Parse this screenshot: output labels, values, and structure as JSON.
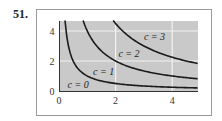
{
  "problem": {
    "number": "51."
  },
  "colors": {
    "plot_bg": "#c9c9c9",
    "grid": "#f2f2f2",
    "curve": "#1a1a1a",
    "frame": "#9a9a9a"
  },
  "chart_data": {
    "type": "line",
    "title": "",
    "xlabel": "",
    "ylabel": "",
    "xlim": [
      0,
      4.9
    ],
    "ylim": [
      0,
      4.7
    ],
    "xticks": [
      0,
      2,
      4
    ],
    "yticks": [
      0,
      2,
      4
    ],
    "grid": true,
    "legend": "none (inline curve labels)",
    "series": [
      {
        "name": "c = 0",
        "label": "c = 0",
        "relation": "level set along the axes (x = 0 or y = 0)",
        "k": 0
      },
      {
        "name": "c = 1",
        "label": "c = 1",
        "relation": "xy = 1",
        "k": 1,
        "points": [
          [
            0.21,
            4.7
          ],
          [
            0.5,
            2.0
          ],
          [
            1,
            1
          ],
          [
            2,
            0.5
          ],
          [
            4,
            0.25
          ],
          [
            4.9,
            0.2
          ]
        ]
      },
      {
        "name": "c = 2",
        "label": "c = 2",
        "relation": "xy = 4",
        "k": 4,
        "points": [
          [
            0.85,
            4.7
          ],
          [
            1,
            4
          ],
          [
            2,
            2
          ],
          [
            4,
            1
          ],
          [
            4.9,
            0.82
          ]
        ]
      },
      {
        "name": "c = 3",
        "label": "c = 3",
        "relation": "xy = 9",
        "k": 9,
        "points": [
          [
            1.91,
            4.7
          ],
          [
            2,
            4.5
          ],
          [
            3,
            3
          ],
          [
            4,
            2.25
          ],
          [
            4.9,
            1.84
          ]
        ]
      }
    ],
    "annotations": [
      {
        "text": "c = 0",
        "x": 0.3,
        "y": 0.4
      },
      {
        "text": "c = 1",
        "x": 1.2,
        "y": 1.3
      },
      {
        "text": "c = 2",
        "x": 2.1,
        "y": 2.5
      },
      {
        "text": "c = 3",
        "x": 3.0,
        "y": 3.6
      }
    ]
  },
  "axes": {
    "x_tick_labels": [
      "0",
      "2",
      "4"
    ],
    "y_tick_labels": [
      "0",
      "2",
      "4"
    ]
  },
  "labels": [
    "c = 0",
    "c = 1",
    "c = 2",
    "c = 3"
  ]
}
